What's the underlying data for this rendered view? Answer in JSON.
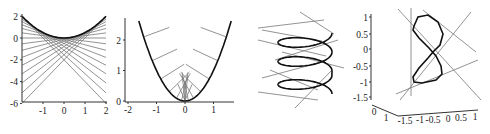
{
  "chart_data": [
    {
      "id": "plot1",
      "type": "line",
      "title": "",
      "description": "Parabola y = x^2/2 with family of tangent lines y = t*x - t^2/2",
      "xlim": [
        -2,
        2
      ],
      "ylim": [
        -6,
        2
      ],
      "xticks": [
        "-1",
        "0",
        "1",
        "2"
      ],
      "xtick_values": [
        -1,
        0,
        1,
        2
      ],
      "yticks": [
        "2",
        "0",
        "-2",
        "-4",
        "-6"
      ],
      "ytick_values": [
        2,
        0,
        -2,
        -4,
        -6
      ],
      "curve": {
        "name": "parabola",
        "a": 0.5
      },
      "tangent_params": [
        -2,
        -1.75,
        -1.5,
        -1.25,
        -1,
        -0.75,
        -0.5,
        -0.25,
        0,
        0.25,
        0.5,
        0.75,
        1,
        1.25,
        1.5,
        1.75,
        2
      ],
      "frame": {
        "x0": 22,
        "x1": 106,
        "y_top": 16,
        "y_bottom": 101
      }
    },
    {
      "id": "plot2",
      "type": "line",
      "title": "",
      "description": "Parabola y = x^2 with inward normal segments",
      "xlim": [
        -2,
        1.6
      ],
      "ylim": [
        0,
        2.6
      ],
      "xticks": [
        "-2",
        "-1",
        "0",
        "1"
      ],
      "xtick_values": [
        -2,
        -1,
        0,
        1
      ],
      "yticks": [
        "2",
        "1",
        "0"
      ],
      "ytick_values": [
        2,
        1,
        0
      ],
      "curve": {
        "name": "parabola",
        "a": 1,
        "x_range": [
          -1.62,
          1.62
        ]
      },
      "normal_points": [
        -1.45,
        -1.15,
        -0.85,
        -0.55,
        -0.3,
        -0.12,
        0.12,
        0.3,
        0.55,
        0.85,
        1.15,
        1.45
      ],
      "normal_length": 0.95
    },
    {
      "id": "plot3",
      "type": "line",
      "title": "",
      "description": "3D helix (three turns) with tangent lines, no axes labels visible",
      "turns": 3,
      "tangent_count": 10
    },
    {
      "id": "plot4",
      "type": "line",
      "title": "",
      "description": "3D figure-eight space curve with tangent lines and box axes",
      "zticks": [
        "1",
        "0.5",
        "0",
        "-0.5",
        "-1",
        "-1.5"
      ],
      "ztick_values": [
        1,
        0.5,
        0,
        -0.5,
        -1,
        -1.5
      ],
      "xticks": [
        "0",
        "1"
      ],
      "yticks": [
        "-1.5",
        "-1",
        "-0.5",
        "0",
        "0.5",
        "1"
      ]
    }
  ]
}
